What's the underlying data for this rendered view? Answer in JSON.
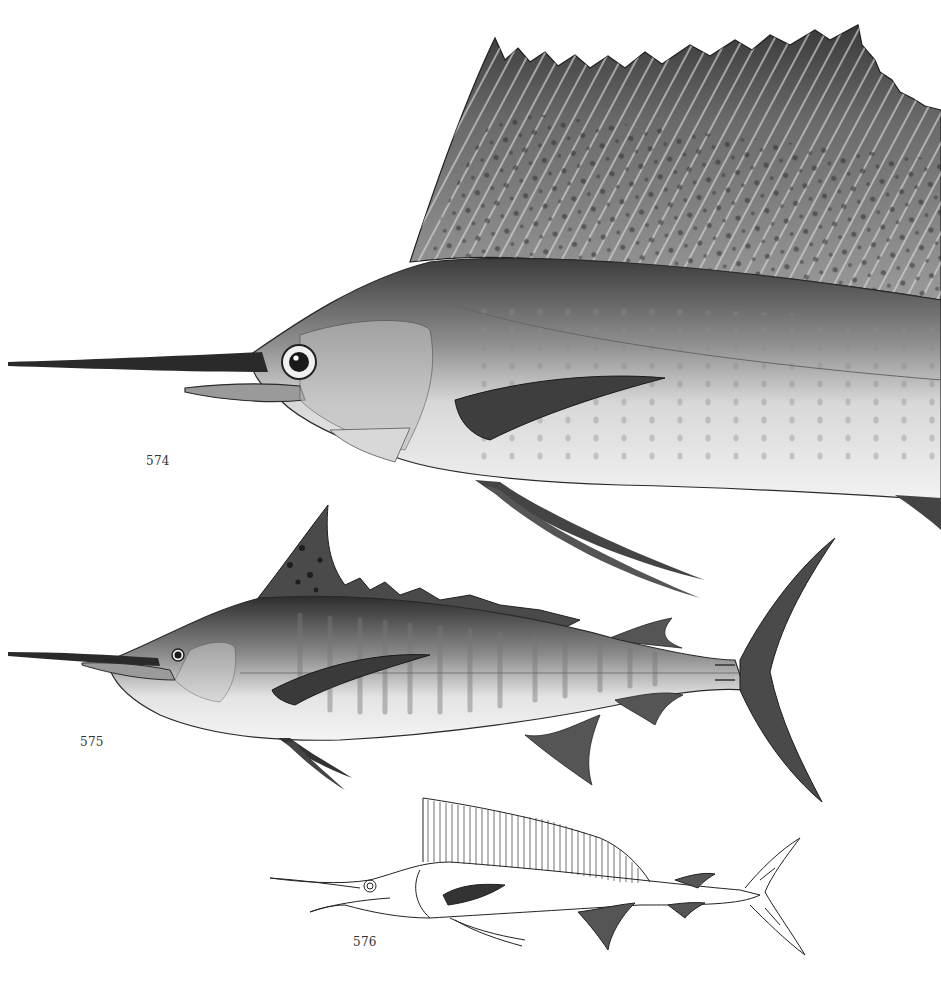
{
  "plate": {
    "figures": [
      {
        "number": "574",
        "description": "sailfish-large-illustration",
        "style": "shaded"
      },
      {
        "number": "575",
        "description": "marlin-full-body-illustration",
        "style": "shaded"
      },
      {
        "number": "576",
        "description": "sailfish-outline-drawing",
        "style": "line-art"
      }
    ]
  },
  "colors": {
    "background": "#ffffff",
    "fin_dark": "#3a3a3a",
    "body_mid": "#8a8a8a",
    "body_light": "#e8e8e8",
    "outline": "#222222"
  }
}
